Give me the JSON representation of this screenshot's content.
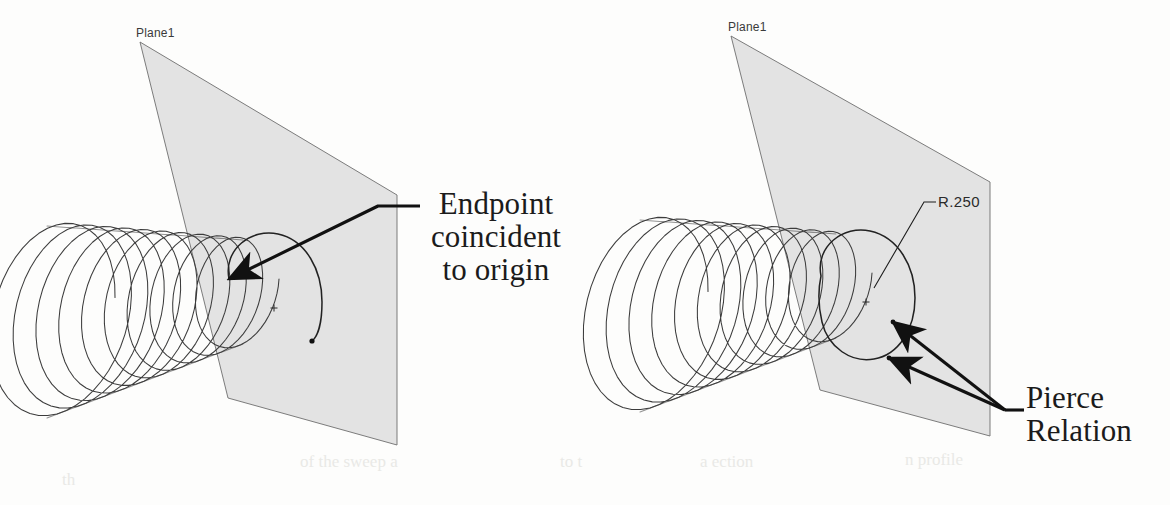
{
  "document": {
    "kind": "cad-illustration",
    "background_color": "#fdfdfc",
    "width": 1170,
    "height": 505
  },
  "palette": {
    "plane_fill": "#e2e2e2",
    "plane_edge": "#6e6e6e",
    "wire_stroke": "#3c3c3c",
    "profile_stroke": "#222222",
    "leader_stroke": "#111111",
    "text_color": "#1b1b1b",
    "cad_label_color": "#3a3a3a"
  },
  "figures": [
    {
      "id": "figure-left",
      "name": "endpoint-coincident-figure",
      "plane": {
        "label": "Plane1",
        "corners": [
          [
            140,
            42
          ],
          [
            397,
            195
          ],
          [
            397,
            445
          ],
          [
            228,
            398
          ]
        ]
      },
      "helix": {
        "turns": 10,
        "start_center": [
          243,
          292
        ],
        "end_center": [
          47,
          322
        ],
        "start_radius_x": 36,
        "start_radius_y": 52,
        "end_radius_x": 68,
        "end_radius_y": 96,
        "shear": -0.36
      },
      "origin_marker": {
        "at": [
          274,
          308
        ],
        "glyph": "+"
      },
      "profile_arc": {
        "comment": "open sweep profile: arc springing from endpoint over the top and down to a free endpoint",
        "start": [
          229,
          279
        ],
        "end": [
          312,
          340
        ],
        "path": "M 229 279 C 223 249, 252 228, 278 234 C 306 240, 322 270, 322 302 C 322 325, 317 337, 312 341"
      },
      "endpoint_dot": [
        312,
        341
      ],
      "annotation": {
        "name": "endpoint-coincident-callout",
        "text": "Endpoint\ncoincident\nto origin",
        "lines": [
          "Endpoint",
          "coincident",
          "to origin"
        ],
        "leader": {
          "elbow": [
            420,
            206
          ],
          "bend": [
            378,
            206
          ],
          "tip": [
            229,
            279
          ]
        }
      }
    },
    {
      "id": "figure-right",
      "name": "pierce-relation-figure",
      "plane": {
        "label": "Plane1",
        "corners": [
          [
            731,
            36
          ],
          [
            990,
            182
          ],
          [
            990,
            436
          ],
          [
            820,
            390
          ]
        ]
      },
      "helix": {
        "turns": 10,
        "start_center": [
          836,
          286
        ],
        "end_center": [
          640,
          316
        ],
        "start_radius_x": 36,
        "start_radius_y": 52,
        "end_radius_x": 68,
        "end_radius_y": 96,
        "shear": -0.36
      },
      "origin_marker": {
        "at": [
          866,
          302
        ],
        "glyph": "+"
      },
      "profile_arc": {
        "comment": "closed R.250 profile circle pierced by the helix at two points",
        "path": "M 821 276 C 815 246, 844 225, 870 231 C 898 237, 915 266, 915 298 C 915 330, 898 355, 874 359 C 852 363, 828 348, 822 322 C 818 305, 818 290, 821 276 Z"
      },
      "pierce_points": [
        [
          893,
          322
        ],
        [
          889,
          358
        ]
      ],
      "radius_dimension": {
        "name": "radius-dimension",
        "text": "R.250",
        "leader": {
          "tip": [
            874,
            288
          ],
          "bend": [
            924,
            202
          ],
          "elbow": [
            936,
            202
          ]
        }
      },
      "annotation": {
        "name": "pierce-relation-callout",
        "text": "Pierce\nRelation",
        "lines": [
          "Pierce",
          "Relation"
        ],
        "leader": {
          "elbow": [
            1024,
            410
          ],
          "hub": [
            1005,
            410
          ],
          "tips": [
            [
              893,
              322
            ],
            [
              889,
              358
            ]
          ]
        }
      }
    }
  ],
  "scan_artifacts": [
    {
      "text": "of the sweep  a",
      "left": 300,
      "top": 452
    },
    {
      "text": "to     t",
      "left": 560,
      "top": 452
    },
    {
      "text": "a  ection",
      "left": 700,
      "top": 452
    },
    {
      "text": "n   profile",
      "left": 905,
      "top": 450
    },
    {
      "text": "th",
      "left": 62,
      "top": 470
    }
  ]
}
